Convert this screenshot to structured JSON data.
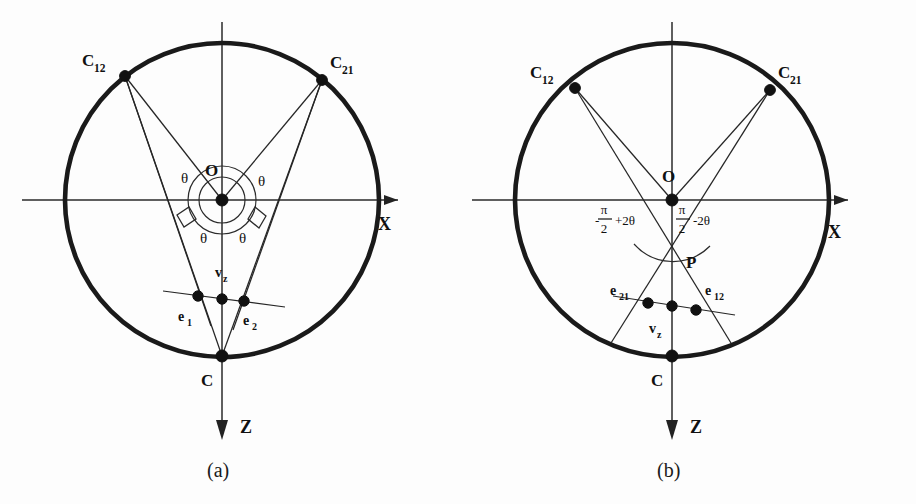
{
  "figure": {
    "type": "geometry-diagram",
    "background_color": "#fdfdfd",
    "ink_color": "#111111"
  },
  "panels": [
    {
      "id": "a",
      "caption": "(a)",
      "center_label": "O",
      "circle": {
        "cx": 222,
        "cy": 200,
        "r": 157
      },
      "axes": {
        "x_label": "X",
        "z_label": "Z"
      },
      "points": [
        {
          "name": "C12",
          "label": "C",
          "sub": "12",
          "x": 125,
          "y": 76
        },
        {
          "name": "C21",
          "label": "C",
          "sub": "21",
          "x": 322,
          "y": 80
        },
        {
          "name": "O",
          "label": "O",
          "sub": "",
          "x": 222,
          "y": 200
        },
        {
          "name": "C",
          "label": "C",
          "sub": "",
          "x": 222,
          "y": 356
        },
        {
          "name": "e1",
          "label": "e",
          "sub": "1",
          "x": 198,
          "y": 296
        },
        {
          "name": "vz",
          "label": "v",
          "sub": "z",
          "x": 222,
          "y": 299
        },
        {
          "name": "e2",
          "label": "e",
          "sub": "2",
          "x": 244,
          "y": 300
        }
      ],
      "angle_labels": [
        "θ",
        "θ",
        "θ",
        "θ"
      ],
      "right_angle_markers": 2
    },
    {
      "id": "b",
      "caption": "(b)",
      "center_label": "O",
      "circle": {
        "cx": 214,
        "cy": 200,
        "r": 157
      },
      "axes": {
        "x_label": "X",
        "z_label": "Z"
      },
      "points": [
        {
          "name": "C12",
          "label": "C",
          "sub": "12",
          "x": 117,
          "y": 88
        },
        {
          "name": "C21",
          "label": "C",
          "sub": "21",
          "x": 312,
          "y": 90
        },
        {
          "name": "O",
          "label": "O",
          "sub": "",
          "x": 214,
          "y": 200
        },
        {
          "name": "P",
          "label": "P",
          "sub": "",
          "x": 214,
          "y": 263
        },
        {
          "name": "C",
          "label": "C",
          "sub": "",
          "x": 214,
          "y": 356
        },
        {
          "name": "e21",
          "label": "e",
          "sub": "21",
          "x": 190,
          "y": 303
        },
        {
          "name": "vz",
          "label": "v",
          "sub": "z",
          "x": 214,
          "y": 306
        },
        {
          "name": "e12",
          "label": "e",
          "sub": "12",
          "x": 238,
          "y": 310
        }
      ],
      "angle_expr_left": {
        "sign": "-",
        "numerator": "π",
        "denominator": "2",
        "tail": "+2θ"
      },
      "angle_expr_right": {
        "sign": "",
        "numerator": "π",
        "denominator": "2",
        "tail": "-2θ"
      }
    }
  ]
}
